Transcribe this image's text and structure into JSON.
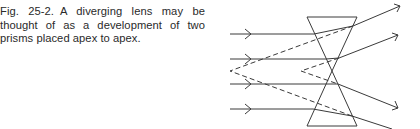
{
  "figure": {
    "number": "Fig. 25-2.",
    "caption": "A diverging lens may be thought of as a development of two prisms placed apex to apex."
  },
  "diagram": {
    "elements": [
      "upper-prism",
      "lower-prism",
      "incoming-rays",
      "outgoing-rays",
      "virtual-rays-dashed"
    ],
    "ray_count": 4,
    "line_color": "#3a3a3a"
  }
}
